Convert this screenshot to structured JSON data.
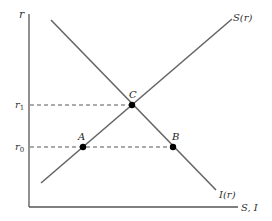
{
  "diagram": {
    "type": "savings-investment-market",
    "colors": {
      "axis": "#555555",
      "curve": "#666666",
      "dashed": "#444444",
      "point": "#000000",
      "text": "#333333"
    },
    "axes": {
      "y_label": "r",
      "x_label": "S, I"
    },
    "curves": [
      {
        "id": "savings",
        "label": "S(r)",
        "slope": "upward"
      },
      {
        "id": "investment",
        "label": "I(r)",
        "slope": "downward"
      }
    ],
    "levels": [
      {
        "id": "r1",
        "label": "r",
        "subscript": "1"
      },
      {
        "id": "r0",
        "label": "r",
        "subscript": "0"
      }
    ],
    "points": [
      {
        "id": "A",
        "label": "A",
        "description": "S(r) at r0"
      },
      {
        "id": "B",
        "label": "B",
        "description": "I(r) at r0"
      },
      {
        "id": "C",
        "label": "C",
        "description": "equilibrium S(r)=I(r) at r1"
      }
    ]
  }
}
